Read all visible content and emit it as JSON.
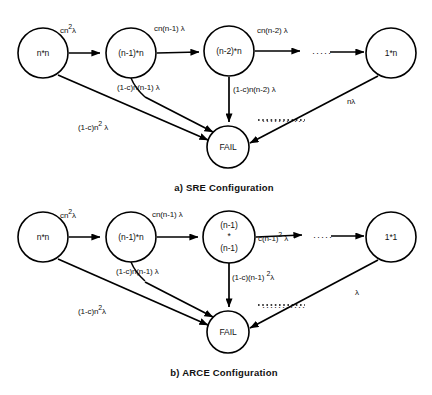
{
  "figure": {
    "ink_color": "#000000",
    "background": "#ffffff"
  },
  "diagrams": [
    {
      "id": "sre",
      "caption": "a)   SRE Configuration",
      "nodes": [
        {
          "id": "a0",
          "label": "n*n",
          "lines": [
            "n*n"
          ],
          "cx": 43,
          "cy": 53,
          "r": 25
        },
        {
          "id": "a1",
          "label": "(n-1)*n",
          "lines": [
            "(n-1)*n"
          ],
          "cx": 131,
          "cy": 53,
          "r": 25
        },
        {
          "id": "a2",
          "label": "(n-2)*n",
          "lines": [
            "(n-2)*n"
          ],
          "cx": 229,
          "cy": 51,
          "r": 25
        },
        {
          "id": "a3",
          "label": "1*n",
          "lines": [
            "1*n"
          ],
          "cx": 391,
          "cy": 53,
          "r": 25
        },
        {
          "id": "afail",
          "label": "FAIL",
          "lines": [
            "FAIL"
          ],
          "cx": 228,
          "cy": 147,
          "r": 21
        }
      ],
      "edge_labels": [
        {
          "id": "a_e0",
          "html": "cn<sup>2</sup>λ",
          "x": 60,
          "y": 27
        },
        {
          "id": "a_e1",
          "html": "cn(n-1) λ",
          "x": 154,
          "y": 25
        },
        {
          "id": "a_e2",
          "html": "cn(n-2) λ",
          "x": 257,
          "y": 27
        },
        {
          "id": "a_f0",
          "html": "(1-c)n<sup>2</sup> λ",
          "x": 78,
          "y": 124
        },
        {
          "id": "a_f1",
          "html": "(1-c)n(n-1)  λ",
          "x": 117,
          "y": 84
        },
        {
          "id": "a_f2",
          "html": "(1-c)n(n-2)  λ",
          "x": 233,
          "y": 86
        },
        {
          "id": "a_f3",
          "html": "nλ",
          "x": 347,
          "y": 98
        }
      ],
      "ellipsis": [
        {
          "id": "a_dots_top",
          "text": "·····",
          "x": 312,
          "y": 49
        },
        {
          "id": "a_dots_fail",
          "text": "···········",
          "x": 262,
          "y": 117
        }
      ],
      "caption_pos": {
        "x": 224,
        "y": 183
      }
    },
    {
      "id": "arce",
      "caption": "b)  ARCE Configuration",
      "nodes": [
        {
          "id": "b0",
          "label": "n*n",
          "lines": [
            "n*n"
          ],
          "cx": 43,
          "cy": 237,
          "r": 25
        },
        {
          "id": "b1",
          "label": "(n-1)*n",
          "lines": [
            "(n-1)*n"
          ],
          "cx": 131,
          "cy": 237,
          "r": 25
        },
        {
          "id": "b2",
          "label": "(n-1) * (n-1)",
          "lines": [
            "(n-1)",
            "*",
            "(n-1)"
          ],
          "cx": 229,
          "cy": 237,
          "r": 26
        },
        {
          "id": "b3",
          "label": "1*1",
          "lines": [
            "1*1"
          ],
          "cx": 391,
          "cy": 237,
          "r": 25
        },
        {
          "id": "bfail",
          "label": "FAIL",
          "lines": [
            "FAIL"
          ],
          "cx": 228,
          "cy": 332,
          "r": 21
        }
      ],
      "edge_labels": [
        {
          "id": "b_e0",
          "html": "cn<sup>2</sup>λ",
          "x": 60,
          "y": 212
        },
        {
          "id": "b_e1",
          "html": "cn(n-1) λ",
          "x": 152,
          "y": 211
        },
        {
          "id": "b_e2",
          "html": "c(n-1)<sup>2</sup> λ",
          "x": 258,
          "y": 235
        },
        {
          "id": "b_f0",
          "html": "(1-c)n<sup>2</sup>λ",
          "x": 78,
          "y": 308
        },
        {
          "id": "b_f1",
          "html": "(1-c)n(n-1)  λ",
          "x": 116,
          "y": 268
        },
        {
          "id": "b_f2",
          "html": "(1-c)(n-1) <sup>2</sup>λ",
          "x": 232,
          "y": 274
        },
        {
          "id": "b_f3",
          "html": "λ",
          "x": 355,
          "y": 289
        }
      ],
      "ellipsis": [
        {
          "id": "b_dots_top",
          "text": "·····",
          "x": 313,
          "y": 233
        },
        {
          "id": "b_dots_fail",
          "text": "···········",
          "x": 262,
          "y": 303
        }
      ],
      "caption_pos": {
        "x": 224,
        "y": 368
      }
    }
  ]
}
